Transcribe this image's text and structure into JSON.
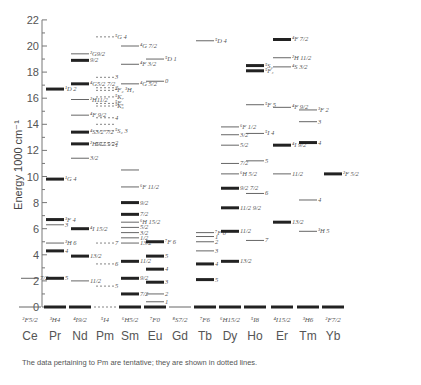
{
  "chart_data": {
    "type": "energy-level diagram (Dieke diagram)",
    "title": "",
    "ylabel": "Energy 1000 cm⁻¹",
    "xlabel": "",
    "ylim": [
      0,
      22
    ],
    "y_major_ticks": [
      0,
      2,
      4,
      6,
      8,
      10,
      12,
      14,
      16,
      18,
      20,
      22
    ],
    "y_minor_step": 1,
    "caption": "The data pertaining to Pm are tentative; they are shown in dotted lines.",
    "categories": [
      "Ce",
      "Pr",
      "Nd",
      "Pm",
      "Sm",
      "Eu",
      "Gd",
      "Tb",
      "Dy",
      "Ho",
      "Er",
      "Tm",
      "Yb"
    ],
    "ground_states": [
      "²F5/2",
      "³H4",
      "⁴I9/2",
      "⁵I4",
      "⁶H5/2",
      "⁷F0",
      "⁸S7/2",
      "⁷F6",
      "⁶H15/2",
      "⁵I8",
      "⁴I15/2",
      "³H6",
      "²F7/2"
    ],
    "series": [
      {
        "name": "Ce",
        "levels": [
          {
            "e": 0,
            "label": "",
            "bold": false
          },
          {
            "e": 2.2,
            "label": "7/2",
            "bold": false
          }
        ]
      },
      {
        "name": "Pr",
        "levels": [
          {
            "e": 0,
            "label": "",
            "bold": true
          },
          {
            "e": 2.2,
            "label": "5",
            "bold": true
          },
          {
            "e": 4.3,
            "label": "4",
            "bold": true
          },
          {
            "e": 4.9,
            "label": "³H 6",
            "bold": false
          },
          {
            "e": 6.3,
            "label": "3",
            "bold": false
          },
          {
            "e": 6.7,
            "label": "³F 4",
            "bold": true
          },
          {
            "e": 9.8,
            "label": "¹G 4",
            "bold": true
          },
          {
            "e": 16.7,
            "label": "¹D 2",
            "bold": true
          }
        ]
      },
      {
        "name": "Nd",
        "levels": [
          {
            "e": 0,
            "label": "",
            "bold": true
          },
          {
            "e": 2.0,
            "label": "11/2",
            "bold": false
          },
          {
            "e": 3.9,
            "label": "13/2",
            "bold": true
          },
          {
            "e": 6.0,
            "label": "⁴I 15/2",
            "bold": true
          },
          {
            "e": 11.4,
            "label": "3/2",
            "bold": false
          },
          {
            "e": 12.5,
            "label": "²H9/2 5/2",
            "bold": true
          },
          {
            "e": 13.4,
            "label": "⁴S3/2 7/2",
            "bold": true
          },
          {
            "e": 14.7,
            "label": "⁴F 9/2",
            "bold": false
          },
          {
            "e": 15.9,
            "label": "²H11/2",
            "bold": false
          },
          {
            "e": 17.1,
            "label": "⁴G5/2 7/2",
            "bold": true
          },
          {
            "e": 18.9,
            "label": "9/2",
            "bold": true
          },
          {
            "e": 19.4,
            "label": "²G9/2",
            "bold": false
          }
        ]
      },
      {
        "name": "Pm",
        "dashed": true,
        "levels": [
          {
            "e": 0,
            "label": "",
            "bold": false
          },
          {
            "e": 1.6,
            "label": "5",
            "bold": false
          },
          {
            "e": 3.3,
            "label": "6",
            "bold": false
          },
          {
            "e": 4.9,
            "label": "7",
            "bold": false
          },
          {
            "e": 12.4,
            "label": "1",
            "bold": false
          },
          {
            "e": 12.6,
            "label": "2",
            "bold": false
          },
          {
            "e": 13.5,
            "label": "⁵S₂ 3",
            "bold": false
          },
          {
            "e": 14.0,
            "label": "",
            "bold": false
          },
          {
            "e": 14.5,
            "label": "4",
            "bold": false
          },
          {
            "e": 15.4,
            "label": "⁵K₆",
            "bold": false
          },
          {
            "e": 15.6,
            "label": "⁵F₃",
            "bold": false
          },
          {
            "e": 16.1,
            "label": "⁵K₇",
            "bold": false
          },
          {
            "e": 16.6,
            "label": "⁵F₂ ³H₄",
            "bold": false
          },
          {
            "e": 16.8,
            "label": "2",
            "bold": false
          },
          {
            "e": 17.6,
            "label": "3",
            "bold": false
          },
          {
            "e": 20.7,
            "label": "⁵G 4",
            "bold": false
          }
        ]
      },
      {
        "name": "Sm",
        "levels": [
          {
            "e": 0,
            "label": "",
            "bold": true
          },
          {
            "e": 1.0,
            "label": "7/2",
            "bold": true
          },
          {
            "e": 2.2,
            "label": "9/2",
            "bold": true
          },
          {
            "e": 3.5,
            "label": "11/2",
            "bold": true
          },
          {
            "e": 4.9,
            "label": "13/2",
            "bold": false
          },
          {
            "e": 5.3,
            "label": "1/2",
            "bold": false
          },
          {
            "e": 5.7,
            "label": "3/2",
            "bold": false
          },
          {
            "e": 6.1,
            "label": "5/2",
            "bold": false
          },
          {
            "e": 6.5,
            "label": "⁶H 15/2",
            "bold": false
          },
          {
            "e": 7.1,
            "label": "7/2",
            "bold": true
          },
          {
            "e": 8.0,
            "label": "9/2",
            "bold": true
          },
          {
            "e": 9.2,
            "label": "⁶F 11/2",
            "bold": false
          },
          {
            "e": 10.5,
            "label": "",
            "bold": false
          },
          {
            "e": 17.1,
            "label": "⁴G 5/2",
            "bold": false
          },
          {
            "e": 18.6,
            "label": "⁴F 3/2",
            "bold": false
          },
          {
            "e": 20.0,
            "label": "⁴G 7/2",
            "bold": false
          }
        ]
      },
      {
        "name": "Eu",
        "levels": [
          {
            "e": 0,
            "label": "",
            "bold": true
          },
          {
            "e": 0.4,
            "label": "1",
            "bold": false
          },
          {
            "e": 1.0,
            "label": "2",
            "bold": false
          },
          {
            "e": 1.9,
            "label": "3",
            "bold": true
          },
          {
            "e": 2.9,
            "label": "4",
            "bold": true
          },
          {
            "e": 3.9,
            "label": "5",
            "bold": true
          },
          {
            "e": 5.0,
            "label": "⁷F 6",
            "bold": true
          },
          {
            "e": 17.3,
            "label": "0",
            "bold": false
          },
          {
            "e": 19.0,
            "label": "⁵D 1",
            "bold": false
          }
        ]
      },
      {
        "name": "Gd",
        "levels": [
          {
            "e": 0,
            "label": "",
            "bold": false
          }
        ]
      },
      {
        "name": "Tb",
        "levels": [
          {
            "e": 0,
            "label": "",
            "bold": true
          },
          {
            "e": 2.1,
            "label": "5",
            "bold": true
          },
          {
            "e": 3.3,
            "label": "4",
            "bold": true
          },
          {
            "e": 4.3,
            "label": "3",
            "bold": false
          },
          {
            "e": 5.0,
            "label": "2",
            "bold": false
          },
          {
            "e": 5.4,
            "label": "1",
            "bold": false
          },
          {
            "e": 5.7,
            "label": "⁷F 0",
            "bold": false
          },
          {
            "e": 20.4,
            "label": "⁵D 4",
            "bold": false
          }
        ]
      },
      {
        "name": "Dy",
        "levels": [
          {
            "e": 0,
            "label": "",
            "bold": true
          },
          {
            "e": 3.5,
            "label": "13/2",
            "bold": true
          },
          {
            "e": 5.8,
            "label": "11/2",
            "bold": true
          },
          {
            "e": 7.6,
            "label": "11/2 9/2",
            "bold": true
          },
          {
            "e": 9.1,
            "label": "9/2 7/2",
            "bold": true
          },
          {
            "e": 10.2,
            "label": "⁶H 5/2",
            "bold": false
          },
          {
            "e": 11.0,
            "label": "7/2",
            "bold": false
          },
          {
            "e": 12.4,
            "label": "5/2",
            "bold": false
          },
          {
            "e": 13.2,
            "label": "3/2",
            "bold": false
          },
          {
            "e": 13.8,
            "label": "⁶F 1/2",
            "bold": false
          }
        ]
      },
      {
        "name": "Ho",
        "levels": [
          {
            "e": 0,
            "label": "",
            "bold": true
          },
          {
            "e": 5.1,
            "label": "7",
            "bold": false
          },
          {
            "e": 8.7,
            "label": "6",
            "bold": false
          },
          {
            "e": 11.2,
            "label": "5",
            "bold": false
          },
          {
            "e": 13.3,
            "label": "⁵I 4",
            "bold": false
          },
          {
            "e": 15.5,
            "label": "⁵F 5",
            "bold": false
          },
          {
            "e": 18.1,
            "label": "⁵F₄",
            "bold": true
          },
          {
            "e": 18.5,
            "label": "⁵S₂",
            "bold": true
          }
        ]
      },
      {
        "name": "Er",
        "levels": [
          {
            "e": 0,
            "label": "",
            "bold": true
          },
          {
            "e": 6.5,
            "label": "13/2",
            "bold": true
          },
          {
            "e": 10.2,
            "label": "11/2",
            "bold": false
          },
          {
            "e": 12.4,
            "label": "⁴I 9/2",
            "bold": true
          },
          {
            "e": 15.3,
            "label": "⁴F 9/2",
            "bold": false
          },
          {
            "e": 18.4,
            "label": "⁴S 3/2",
            "bold": false
          },
          {
            "e": 19.1,
            "label": "²H 11/2",
            "bold": false
          },
          {
            "e": 20.5,
            "label": "⁴F 7/2",
            "bold": true
          }
        ]
      },
      {
        "name": "Tm",
        "levels": [
          {
            "e": 0,
            "label": "",
            "bold": true
          },
          {
            "e": 5.8,
            "label": "³H 5",
            "bold": false
          },
          {
            "e": 8.2,
            "label": "4",
            "bold": false
          },
          {
            "e": 12.6,
            "label": "4",
            "bold": true
          },
          {
            "e": 14.2,
            "label": "3",
            "bold": false
          },
          {
            "e": 15.1,
            "label": "³F 2",
            "bold": false
          }
        ]
      },
      {
        "name": "Yb",
        "levels": [
          {
            "e": 0,
            "label": "",
            "bold": true
          },
          {
            "e": 10.2,
            "label": "²F 5/2",
            "bold": true
          }
        ]
      }
    ]
  }
}
